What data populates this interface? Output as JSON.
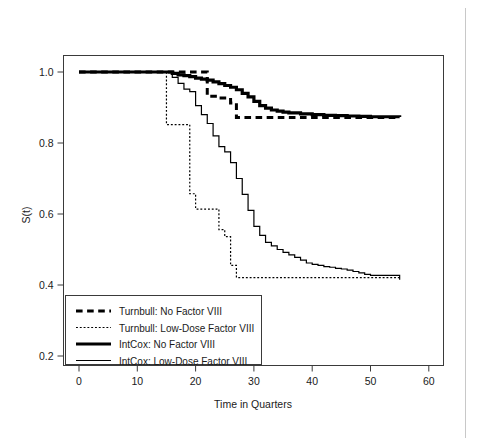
{
  "chart_data": {
    "type": "line",
    "title": "",
    "subtitle": "",
    "xlabel": "Time in Quarters",
    "ylabel": "S(t)",
    "xlim": [
      -2,
      63
    ],
    "ylim": [
      0.17,
      1.03
    ],
    "xticks": [
      0,
      10,
      20,
      30,
      40,
      50,
      60
    ],
    "xtick_labels": [
      "0",
      "10",
      "20",
      "30",
      "40",
      "50",
      "60"
    ],
    "yticks": [
      0.2,
      0.4,
      0.6,
      0.8,
      1.0
    ],
    "ytick_labels": [
      "0.2",
      "0.4",
      "0.6",
      "0.8",
      "1.0"
    ],
    "grid": false,
    "legend_position": "bottom-left",
    "step_type": "post",
    "series": [
      {
        "name": "Turnbull: No Factor VIII",
        "style": "dashed",
        "width": 3.0,
        "color": "#000000",
        "x": [
          0,
          22,
          22,
          24,
          24,
          26,
          26,
          27,
          27,
          55
        ],
        "y": [
          1.0,
          1.0,
          0.932,
          0.932,
          0.927,
          0.927,
          0.913,
          0.913,
          0.872,
          0.872
        ]
      },
      {
        "name": "Turnbull: Low-Dose Factor VIII",
        "style": "dotted",
        "width": 1.2,
        "color": "#000000",
        "x": [
          0,
          15,
          15,
          19,
          19,
          20,
          20,
          24,
          24,
          25,
          25,
          26,
          26,
          27,
          27,
          55
        ],
        "y": [
          1.0,
          1.0,
          0.852,
          0.852,
          0.657,
          0.657,
          0.614,
          0.614,
          0.556,
          0.556,
          0.536,
          0.536,
          0.455,
          0.455,
          0.421,
          0.421
        ]
      },
      {
        "name": "IntCox: No Factor VIII",
        "style": "solid",
        "width": 3.2,
        "color": "#000000",
        "x": [
          0,
          15,
          16,
          17,
          18,
          19,
          20,
          21,
          22,
          23,
          24,
          25,
          26,
          27,
          28,
          29,
          30,
          31,
          32,
          33,
          34,
          35,
          36,
          38,
          40,
          42,
          44,
          46,
          48,
          50,
          55
        ],
        "y": [
          1.0,
          1.0,
          0.996,
          0.992,
          0.99,
          0.987,
          0.983,
          0.98,
          0.977,
          0.972,
          0.967,
          0.962,
          0.957,
          0.95,
          0.94,
          0.93,
          0.917,
          0.905,
          0.898,
          0.893,
          0.89,
          0.887,
          0.885,
          0.882,
          0.88,
          0.878,
          0.877,
          0.876,
          0.875,
          0.874,
          0.873
        ]
      },
      {
        "name": "IntCox: Low-Dose Factor VIII",
        "style": "solid",
        "width": 1.2,
        "color": "#000000",
        "x": [
          0,
          15,
          16,
          17,
          18,
          19,
          20,
          21,
          22,
          23,
          24,
          25,
          26,
          27,
          28,
          29,
          30,
          31,
          32,
          33,
          34,
          35,
          36,
          37,
          38,
          39,
          40,
          41,
          42,
          43,
          44,
          45,
          46,
          47,
          48,
          49,
          50,
          55
        ],
        "y": [
          1.0,
          1.0,
          0.985,
          0.968,
          0.952,
          0.945,
          0.905,
          0.88,
          0.855,
          0.82,
          0.79,
          0.775,
          0.745,
          0.7,
          0.655,
          0.61,
          0.565,
          0.54,
          0.52,
          0.51,
          0.5,
          0.492,
          0.485,
          0.478,
          0.47,
          0.462,
          0.458,
          0.455,
          0.452,
          0.45,
          0.447,
          0.445,
          0.442,
          0.438,
          0.434,
          0.43,
          0.427,
          0.415
        ]
      }
    ],
    "legend_entries": [
      {
        "label": "Turnbull: No Factor VIII",
        "style": "dashed",
        "width": 3.0,
        "color": "#000000"
      },
      {
        "label": "Turnbull: Low-Dose Factor VIII",
        "style": "dotted",
        "width": 1.2,
        "color": "#000000"
      },
      {
        "label": "IntCox: No Factor VIII",
        "style": "solid",
        "width": 3.2,
        "color": "#000000"
      },
      {
        "label": "IntCox: Low-Dose Factor VIII",
        "style": "solid",
        "width": 1.2,
        "color": "#000000"
      }
    ]
  }
}
